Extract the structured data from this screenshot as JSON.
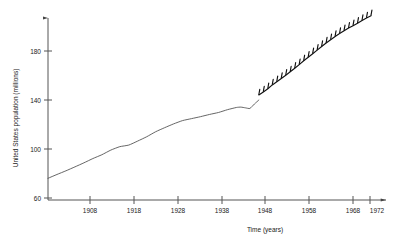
{
  "chart_data": {
    "type": "line",
    "title": "",
    "xlabel": "Time (years)",
    "ylabel": "United States population (millions)",
    "xlim": [
      1900,
      1974
    ],
    "ylim": [
      60,
      212
    ],
    "grid": false,
    "legend": null,
    "x_ticks": [
      1908,
      1918,
      1928,
      1938,
      1948,
      1958,
      1968,
      1972
    ],
    "x_tick_labels": [
      "1908",
      "1918",
      "1928",
      "1938",
      "1948",
      "1958",
      "1968",
      "1972"
    ],
    "y_ticks": [
      60,
      100,
      140,
      180
    ],
    "y_tick_labels": [
      "60",
      "100",
      "140",
      "180"
    ],
    "series": [
      {
        "name": "estimated population (smooth trend)",
        "style": "thin-line",
        "markers": false,
        "x": [
          1900,
          1902,
          1904,
          1906,
          1908,
          1910,
          1912,
          1914,
          1916,
          1918,
          1920,
          1922,
          1924,
          1926,
          1928,
          1930,
          1932,
          1934,
          1936,
          1938,
          1940,
          1942,
          1943,
          1944,
          1945,
          1946,
          1947
        ],
        "values": [
          76.1,
          79.2,
          82.2,
          85.4,
          88.7,
          92.2,
          95.3,
          99.1,
          101.9,
          103.2,
          106.5,
          110.0,
          114.1,
          117.4,
          120.5,
          123.2,
          124.8,
          126.4,
          128.2,
          129.8,
          132.1,
          133.9,
          134.2,
          133.6,
          133.1,
          136.7,
          140.0
        ]
      },
      {
        "name": "measured population",
        "style": "thick-line-with-tick-markers",
        "markers": true,
        "x": [
          1947,
          1948,
          1949,
          1950,
          1951,
          1952,
          1953,
          1954,
          1955,
          1956,
          1957,
          1958,
          1959,
          1960,
          1961,
          1962,
          1963,
          1964,
          1965,
          1966,
          1967,
          1968,
          1969,
          1970,
          1971,
          1972
        ],
        "values": [
          144.1,
          146.6,
          149.2,
          152.3,
          154.9,
          157.6,
          160.2,
          163.0,
          165.9,
          168.9,
          172.0,
          174.9,
          177.8,
          180.7,
          183.7,
          186.5,
          189.2,
          191.9,
          194.3,
          196.6,
          198.7,
          200.7,
          202.7,
          204.9,
          207.0,
          208.8
        ]
      }
    ]
  },
  "axes": {
    "y_axis_caption": "United States population (millions)",
    "x_axis_caption": "Time (years)"
  },
  "icons": {
    "y_axis_arrow": "arrow-up-icon",
    "x_axis_arrow": "arrow-right-icon"
  }
}
